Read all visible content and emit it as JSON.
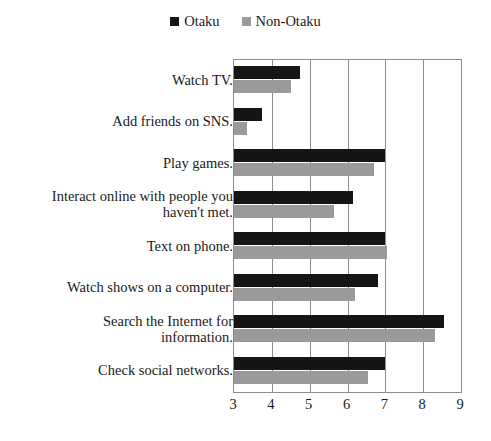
{
  "chart_data": {
    "type": "bar",
    "orientation": "horizontal",
    "title": "",
    "subtitle": "",
    "xlabel": "",
    "ylabel": "",
    "xlim": [
      3,
      9
    ],
    "xticks": [
      3,
      4,
      5,
      6,
      7,
      8,
      9
    ],
    "grid": true,
    "grid_axis": "x",
    "legend_position": "top-center",
    "categories": [
      "Watch TV.",
      "Add friends on SNS.",
      "Play games.",
      "Interact online with people you\nhaven't met.",
      "Text on phone.",
      "Watch shows on a computer.",
      "Search the Internet for\ninformation.",
      "Check social networks."
    ],
    "series": [
      {
        "name": "Otaku",
        "color": "#151515",
        "values": [
          4.75,
          3.75,
          7.0,
          6.15,
          7.0,
          6.8,
          8.55,
          7.0
        ]
      },
      {
        "name": "Non-Otaku",
        "color": "#9a9a9a",
        "values": [
          4.5,
          3.35,
          6.7,
          5.65,
          7.05,
          6.2,
          8.3,
          6.55
        ]
      }
    ]
  },
  "legend": {
    "entries": [
      {
        "label": "Otaku",
        "color": "#151515"
      },
      {
        "label": "Non-Otaku",
        "color": "#9a9a9a"
      }
    ]
  }
}
